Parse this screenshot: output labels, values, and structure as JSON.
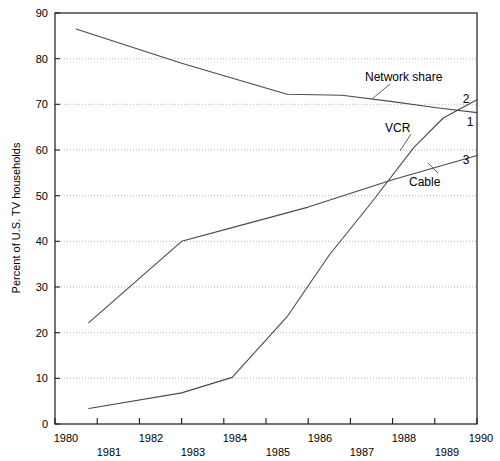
{
  "chart_data": {
    "type": "line",
    "title": "",
    "xlabel": "",
    "ylabel": "Percent of U.S. TV households",
    "xlim": [
      1980,
      1990
    ],
    "ylim": [
      0,
      90
    ],
    "grid": true,
    "legend_position": "inline-annotations",
    "x_ticks": [
      1980,
      1981,
      1982,
      1983,
      1984,
      1985,
      1986,
      1987,
      1988,
      1989,
      1990
    ],
    "x_tick_labels": [
      "1980",
      "1981",
      "1982",
      "1983",
      "1984",
      "1985",
      "1986",
      "1987",
      "1988",
      "1989",
      "1990"
    ],
    "y_ticks": [
      0,
      10,
      20,
      30,
      40,
      50,
      60,
      70,
      80,
      90
    ],
    "y_tick_labels": [
      "0",
      "10",
      "20",
      "30",
      "40",
      "50",
      "60",
      "70",
      "80",
      "90"
    ],
    "series": [
      {
        "name": "Network share",
        "end_marker": "1",
        "x": [
          1980.5,
          1983.0,
          1985.5,
          1986.8,
          1988.0,
          1989.0,
          1990.0
        ],
        "values": [
          86.5,
          79.0,
          72.2,
          72.0,
          70.6,
          69.3,
          68.2
        ]
      },
      {
        "name": "VCR",
        "end_marker": "2",
        "x": [
          1980.8,
          1983.0,
          1984.2,
          1985.5,
          1986.5,
          1987.5,
          1988.5,
          1989.2,
          1990.0
        ],
        "values": [
          3.4,
          6.8,
          10.2,
          23.5,
          37.0,
          48.5,
          60.5,
          67.0,
          71.0
        ]
      },
      {
        "name": "Cable",
        "end_marker": "3",
        "x": [
          1980.8,
          1983.0,
          1984.2,
          1986.0,
          1988.0,
          1990.0
        ],
        "values": [
          22.2,
          40.0,
          43.0,
          47.5,
          53.5,
          58.8
        ]
      }
    ],
    "annotations": [
      {
        "text": "Network share",
        "series": "Network share"
      },
      {
        "text": "VCR",
        "series": "VCR"
      },
      {
        "text": "Cable",
        "series": "Cable"
      }
    ]
  },
  "axis": {
    "y_title": "Percent of U.S. TV households",
    "y_labels": [
      "90",
      "80",
      "70",
      "60",
      "50",
      "40",
      "30",
      "20",
      "10",
      "0"
    ],
    "x_labels_top": [
      "1980",
      "1982",
      "1984",
      "1986",
      "1988",
      "1990"
    ],
    "x_labels_bottom": [
      "1981",
      "1983",
      "1985",
      "1987",
      "1989"
    ]
  },
  "labels": {
    "network": "Network share",
    "vcr": "VCR",
    "cable": "Cable",
    "marker_network": "1",
    "marker_vcr": "2",
    "marker_cable": "3"
  },
  "colors": {
    "background": "#ffffff",
    "line": "#4a4a4a",
    "axis": "#1a1a1a",
    "grid": "#aeaeae",
    "text": "#000000"
  }
}
